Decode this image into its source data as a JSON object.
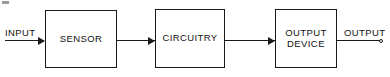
{
  "diagram": {
    "background_color": "#ffffff",
    "line_color": "#1a1a1a",
    "text_color": "#111111",
    "input_port": {
      "label": "INPUT"
    },
    "output_port": {
      "label": "OUTPUT"
    },
    "blocks": [
      {
        "id": "sensor",
        "label": "SENSOR"
      },
      {
        "id": "circuitry",
        "label": "CIRCUITRY"
      },
      {
        "id": "output-device",
        "label": "OUTPUT\nDEVICE"
      }
    ],
    "connectors": [
      {
        "id": "input-to-sensor",
        "from": "INPUT",
        "to": "SENSOR",
        "arrow": true
      },
      {
        "id": "sensor-to-circuitry",
        "from": "SENSOR",
        "to": "CIRCUITRY",
        "arrow": true
      },
      {
        "id": "circuitry-to-output-device",
        "from": "CIRCUITRY",
        "to": "OUTPUT DEVICE",
        "arrow": true
      },
      {
        "id": "output-device-to-output",
        "from": "OUTPUT DEVICE",
        "to": "OUTPUT",
        "arrow": false
      }
    ]
  }
}
